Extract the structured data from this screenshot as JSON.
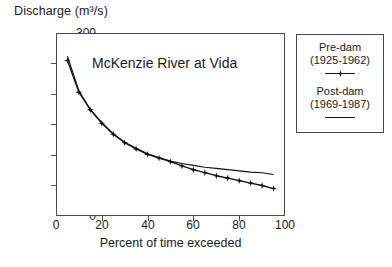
{
  "chart_data": {
    "type": "line",
    "title": "Discharge (m³/s)",
    "annotation": "McKenzie River at Vida",
    "xlabel": "Percent of time exceeded",
    "ylabel": "Discharge (m³/s)",
    "xlim": [
      0,
      100
    ],
    "ylim": [
      0,
      300
    ],
    "xticks": [
      0,
      20,
      40,
      60,
      80,
      100
    ],
    "yticks": [
      0,
      50,
      100,
      150,
      200,
      250,
      300
    ],
    "grid": false,
    "legend_position": "right",
    "series": [
      {
        "name": "Pre-dam (1925-1962)",
        "marker": "star",
        "line": "solid",
        "color": "#111111",
        "x": [
          5,
          10,
          15,
          20,
          25,
          30,
          35,
          40,
          45,
          50,
          55,
          60,
          65,
          70,
          75,
          80,
          85,
          90,
          95
        ],
        "y": [
          255,
          203,
          174,
          152,
          134,
          120,
          110,
          101,
          95,
          89,
          82,
          76,
          71,
          66,
          62,
          58,
          54,
          50,
          45
        ]
      },
      {
        "name": "Post-dam (1969-1987)",
        "marker": "none",
        "line": "solid",
        "color": "#111111",
        "x": [
          5,
          10,
          15,
          20,
          25,
          30,
          35,
          40,
          45,
          50,
          55,
          60,
          65,
          70,
          75,
          80,
          85,
          90,
          95
        ],
        "y": [
          262,
          205,
          175,
          153,
          135,
          121,
          111,
          102,
          96,
          90,
          86,
          83,
          80,
          78,
          76,
          74,
          72,
          71,
          68
        ]
      }
    ]
  },
  "axis": {
    "y_title": "Discharge (m³/s)",
    "y_ticks": [
      "300",
      "250",
      "200",
      "150",
      "100",
      "50",
      "0"
    ],
    "x_ticks": [
      "0",
      "20",
      "40",
      "60",
      "80",
      "100"
    ],
    "x_title": "Percent of time exceeded"
  },
  "plot": {
    "annotation": "McKenzie River at Vida"
  },
  "legend": {
    "entry1_line1": "Pre-dam",
    "entry1_line2": "(1925-1962)",
    "entry2_line1": "Post-dam",
    "entry2_line2": "(1969-1987)"
  }
}
